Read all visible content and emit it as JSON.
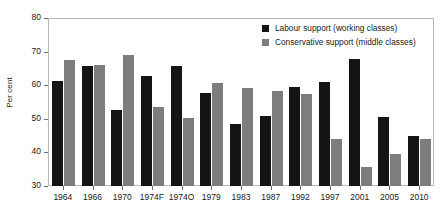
{
  "chart_data": {
    "type": "bar",
    "title": "",
    "xlabel": "",
    "ylabel": "Per cent",
    "ylim": [
      30,
      80
    ],
    "yticks": [
      30,
      40,
      50,
      60,
      70,
      80
    ],
    "grid": false,
    "legend_position": "top-right",
    "categories": [
      "1964",
      "1966",
      "1970",
      "1974F",
      "1974O",
      "1979",
      "1983",
      "1987",
      "1992",
      "1997",
      "2001",
      "2005",
      "2010"
    ],
    "series": [
      {
        "name": "Labour support (working classes)",
        "color": "#141414",
        "values": [
          61.3,
          65.7,
          52.7,
          62.8,
          65.7,
          57.6,
          48.5,
          50.8,
          59.5,
          61.0,
          67.8,
          50.4,
          44.8
        ]
      },
      {
        "name": "Conservative support (middle classes)",
        "color": "#7d7d7d",
        "values": [
          67.5,
          66.0,
          69.0,
          53.5,
          50.2,
          60.6,
          59.1,
          58.3,
          57.4,
          44.0,
          35.6,
          39.5,
          43.9
        ]
      }
    ]
  },
  "legend": {
    "items": [
      {
        "label": "Labour support (working classes)",
        "swatch": "labour"
      },
      {
        "label": "Conservative support (middle classes)",
        "swatch": "cons"
      }
    ]
  }
}
